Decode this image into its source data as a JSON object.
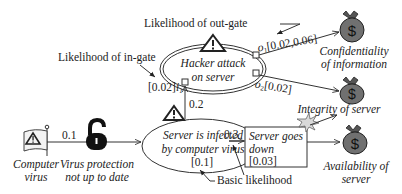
{
  "annotations": {
    "out_gate": "Likelihood of out-gate",
    "in_gate": "Likelihood of in-gate",
    "basic": "Basic likelihood"
  },
  "threat_source": {
    "line1": "Computer",
    "line2": "virus"
  },
  "vulnerability": {
    "line1": "Virus protection",
    "line2": "not up to date",
    "prob": "0.1"
  },
  "hacker": {
    "line1": "Hacker attack",
    "line2": "on server",
    "in_gate_value": "[0.02]",
    "in_gate_label": "i",
    "in_gate_sub": "1",
    "out1_label": "o",
    "out1_sub": "1",
    "out1_value": "[0.02,0.06]",
    "out2_label": "o",
    "out2_sub": "2",
    "out2_value": "[0.02]"
  },
  "infected": {
    "line1": "Server is infected",
    "line2": "by computer virus",
    "value": "[0.1]",
    "to_hacker_prob": "0.2",
    "to_down_prob": "0.3"
  },
  "server_down": {
    "line1": "Server goes",
    "line2": "down",
    "value": "[0.03]"
  },
  "assets": {
    "confidentiality": {
      "line1": "Confidentiality",
      "line2": "of information",
      "symbol": "$"
    },
    "integrity": {
      "line1": "Integrity of server",
      "symbol": "$"
    },
    "availability": {
      "line1": "Availability of",
      "line2": "server",
      "symbol": "$"
    }
  },
  "colors": {
    "bag": "#6e6e6e",
    "line": "#333333",
    "lock": "#111111",
    "burst": "#d9d9d9"
  }
}
